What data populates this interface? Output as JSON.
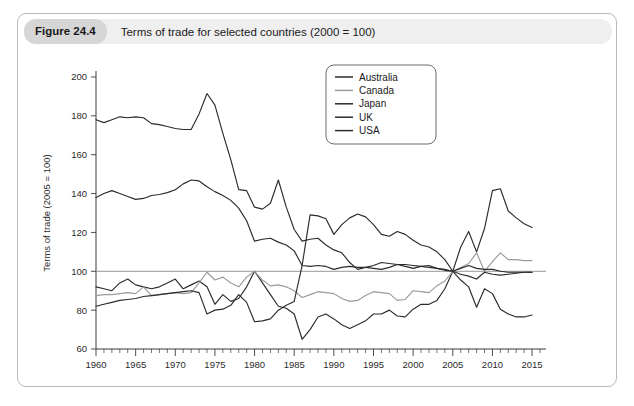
{
  "figure": {
    "number_label": "Figure 24.4",
    "caption": "Terms of trade for selected countries (2000 = 100)",
    "bottom_caption": ""
  },
  "chart_data": {
    "type": "line",
    "title": "Terms of trade for selected countries (2000 = 100)",
    "xlabel": "",
    "ylabel": "Terms of trade (2005 = 100)",
    "xlim": [
      1960,
      2016
    ],
    "ylim": [
      60,
      200
    ],
    "ytick_values": [
      60,
      80,
      100,
      120,
      140,
      160,
      180,
      200
    ],
    "ytick_labels": [
      "60",
      "80",
      "100",
      "120",
      "140",
      "160",
      "180",
      "200"
    ],
    "xtick_values": [
      1960,
      1965,
      1970,
      1975,
      1980,
      1985,
      1990,
      1995,
      2000,
      2005,
      2010,
      2015
    ],
    "xtick_labels": [
      "1960",
      "1965",
      "1970",
      "1975",
      "1980",
      "1985",
      "1990",
      "1995",
      "2000",
      "2005",
      "2010",
      "2015"
    ],
    "minor_xtick_interval": 1,
    "grid": false,
    "reference_line_y": 100,
    "legend_position": "upper-center-right",
    "x": [
      1960,
      1961,
      1962,
      1963,
      1964,
      1965,
      1966,
      1967,
      1968,
      1969,
      1970,
      1971,
      1972,
      1973,
      1974,
      1975,
      1976,
      1977,
      1978,
      1979,
      1980,
      1981,
      1982,
      1983,
      1984,
      1985,
      1986,
      1987,
      1988,
      1989,
      1990,
      1991,
      1992,
      1993,
      1994,
      1995,
      1996,
      1997,
      1998,
      1999,
      2000,
      2001,
      2002,
      2003,
      2004,
      2005,
      2006,
      2007,
      2008,
      2009,
      2010,
      2011,
      2012,
      2013,
      2014,
      2015
    ],
    "series": [
      {
        "name": "Australia",
        "color": "#2b2b2b",
        "values": [
          92.0,
          91.0,
          90.0,
          94.0,
          96.0,
          93.0,
          92.0,
          91.0,
          92.0,
          94.0,
          96.0,
          91.0,
          93.0,
          95.0,
          92.0,
          83.0,
          88.0,
          84.5,
          86.0,
          92.0,
          100.0,
          94.0,
          88.0,
          82.0,
          81.0,
          78.0,
          65.0,
          70.0,
          76.5,
          78.0,
          75.5,
          72.5,
          70.5,
          72.5,
          74.5,
          78.0,
          78.0,
          80.0,
          77.0,
          76.5,
          80.5,
          83.0,
          83.0,
          85.0,
          91.0,
          100.0,
          112.5,
          120.5,
          110.0,
          122.0,
          141.5,
          142.5,
          131.0,
          127.5,
          124.5,
          122.5
        ]
      },
      {
        "name": "Canada",
        "color": "#9a9a9a",
        "values": [
          87.5,
          88.0,
          88.0,
          88.5,
          89.0,
          88.5,
          92.0,
          87.5,
          88.0,
          88.5,
          89.0,
          88.5,
          89.0,
          94.0,
          99.5,
          95.5,
          97.0,
          94.0,
          92.0,
          97.0,
          100.0,
          95.5,
          92.5,
          93.0,
          92.0,
          90.0,
          86.5,
          88.0,
          89.5,
          89.0,
          88.5,
          86.0,
          84.5,
          85.0,
          87.5,
          89.5,
          89.0,
          88.5,
          85.0,
          85.5,
          90.0,
          89.5,
          89.0,
          92.5,
          95.0,
          100.0,
          102.0,
          104.0,
          109.5,
          100.0,
          105.0,
          109.5,
          106.0,
          106.0,
          105.5,
          105.5
        ]
      },
      {
        "name": "Japan",
        "color": "#2b2b2b",
        "values": [
          82.0,
          83.0,
          84.0,
          85.0,
          85.5,
          86.0,
          87.0,
          87.5,
          88.0,
          88.5,
          89.0,
          89.5,
          90.0,
          89.0,
          78.0,
          80.0,
          80.5,
          82.5,
          88.0,
          84.0,
          74.0,
          74.5,
          75.5,
          80.0,
          82.5,
          84.5,
          103.0,
          129.0,
          128.5,
          127.0,
          119.0,
          124.0,
          127.5,
          129.5,
          128.0,
          124.0,
          119.0,
          118.0,
          120.5,
          119.0,
          116.0,
          113.5,
          112.5,
          110.0,
          106.0,
          100.0,
          95.5,
          92.0,
          81.5,
          91.0,
          88.5,
          80.5,
          78.0,
          76.5,
          76.5,
          77.5
        ]
      },
      {
        "name": "UK",
        "color": "#2b2b2b",
        "values": [
          178.0,
          176.5,
          178.0,
          179.5,
          179.0,
          179.5,
          179.0,
          176.0,
          175.5,
          174.5,
          173.5,
          173.0,
          173.0,
          181.0,
          191.5,
          185.5,
          171.0,
          157.5,
          142.0,
          141.5,
          133.0,
          132.0,
          135.0,
          147.0,
          133.0,
          121.5,
          115.5,
          116.5,
          117.0,
          113.5,
          111.0,
          109.5,
          104.5,
          101.0,
          102.0,
          103.0,
          104.5,
          104.0,
          103.5,
          103.5,
          103.0,
          102.5,
          102.0,
          101.5,
          101.0,
          100.0,
          101.5,
          103.0,
          101.5,
          101.0,
          101.0,
          100.0,
          99.5,
          99.5,
          99.5,
          99.5
        ]
      },
      {
        "name": "USA",
        "color": "#2b2b2b",
        "values": [
          138.0,
          140.0,
          141.5,
          140.0,
          138.5,
          137.0,
          137.5,
          139.0,
          139.5,
          140.5,
          142.0,
          145.0,
          147.0,
          146.5,
          143.5,
          141.0,
          139.0,
          136.5,
          132.5,
          126.0,
          115.5,
          116.5,
          117.0,
          115.0,
          113.5,
          110.5,
          103.0,
          102.5,
          103.0,
          102.5,
          101.0,
          102.0,
          102.5,
          102.0,
          102.0,
          101.5,
          101.0,
          102.0,
          103.5,
          102.5,
          101.5,
          102.5,
          103.0,
          101.5,
          100.5,
          100.0,
          98.5,
          97.5,
          96.0,
          99.5,
          98.5,
          98.0,
          98.5,
          99.0,
          99.5,
          99.5
        ]
      }
    ]
  }
}
